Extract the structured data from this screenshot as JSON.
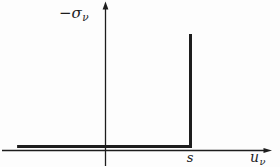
{
  "figure": {
    "ylabel": {
      "base": "−σ",
      "sub": "ν"
    },
    "xlabel": {
      "base": "u",
      "sub": "ν"
    },
    "s_marker": "s"
  },
  "colors": {
    "ink": "#1d1d1d",
    "background": "#fdfdfd"
  },
  "chart_data": {
    "type": "line",
    "title": "",
    "xlabel": "u_ν",
    "ylabel": "−σ_ν",
    "grid": false,
    "legend": "none",
    "x_ticks": [
      {
        "label": "s",
        "x": 1
      }
    ],
    "y_ticks": [],
    "axis_note": "qualitative sketch; x-axis unit chosen so that the tick s = 1, origin at axes crossing",
    "series": [
      {
        "name": "unilateral-contact-law",
        "description": "−σ_ν = 0 for u_ν < s; vertical unbounded branch at u_ν = s",
        "points": [
          [
            -1.04,
            0
          ],
          [
            1,
            0
          ],
          [
            1,
            "inf"
          ]
        ]
      }
    ]
  }
}
